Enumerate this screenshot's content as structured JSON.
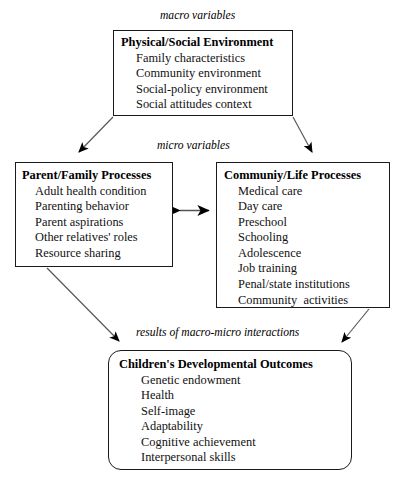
{
  "captions": {
    "macro": "macro variables",
    "micro": "micro variables",
    "results": "results of macro-micro interactions"
  },
  "boxes": {
    "macro_environment": {
      "title": "Physical/Social Environment",
      "items": [
        "Family characteristics",
        "Community environment",
        "Social-policy environment",
        "Social attitudes context"
      ]
    },
    "parent_family": {
      "title": "Parent/Family Processes",
      "items": [
        "Adult health condition",
        "Parenting behavior",
        "Parent aspirations",
        "Other relatives' roles",
        "Resource sharing"
      ]
    },
    "community_life": {
      "title": "Communiy/Life Processes",
      "items": [
        "Medical care",
        "Day care",
        "Preschool",
        "Schooling",
        "Adolescence",
        "Job training",
        "Penal/state institutions",
        "Community  activities"
      ]
    },
    "outcomes": {
      "title": "Children's Developmental Outcomes",
      "items": [
        "Genetic endowment",
        "Health",
        "Self-image",
        "Adaptability",
        "Cognitive achievement",
        "Interpersonal skills"
      ]
    }
  },
  "colors": {
    "border": "#1a1a1a",
    "connector": "#555555",
    "arrowhead": "#000000",
    "text": "#000000",
    "background": "#ffffff"
  }
}
